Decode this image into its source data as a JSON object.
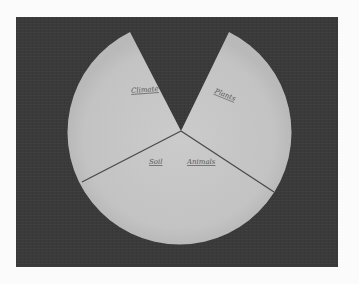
{
  "scene": {
    "description": "Paper plate cut into a pie-style diagram on dark background",
    "background_color": "#3a3a3a",
    "plate_color": "#c4c4c4"
  },
  "sections": [
    {
      "label": "Climate"
    },
    {
      "label": "Plants"
    },
    {
      "label": "Soil"
    },
    {
      "label": "Animals"
    }
  ]
}
